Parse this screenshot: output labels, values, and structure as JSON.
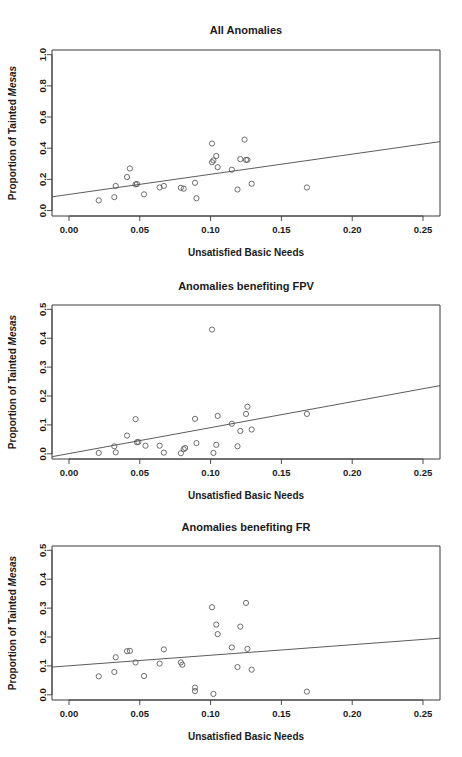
{
  "figure": {
    "shared_xlabel": "Unsatisfied Basic Needs",
    "shared_ylabel_prefix": "Proportion of Tainted ",
    "shared_ylabel_italic": "Mesas"
  },
  "chart_data": [
    {
      "type": "scatter",
      "title": "All Anomalies",
      "xlabel": "Unsatisfied Basic Needs",
      "ylabel": "Proportion of Tainted Mesas",
      "xlim": [
        -0.012,
        0.262
      ],
      "ylim": [
        -0.035,
        1.03
      ],
      "xticks": [
        0.0,
        0.05,
        0.1,
        0.15,
        0.2,
        0.25
      ],
      "xticklabels": [
        "0.00",
        "0.05",
        "0.10",
        "0.15",
        "0.20",
        "0.25"
      ],
      "yticks": [
        0.0,
        0.2,
        0.4,
        0.6,
        0.8,
        1.0
      ],
      "yticklabels": [
        "0.0",
        "0.2",
        "0.4",
        "0.6",
        "0.8",
        "1.0"
      ],
      "grid": false,
      "legend": "none",
      "marker": "open-circle",
      "x": [
        0.021,
        0.032,
        0.033,
        0.041,
        0.043,
        0.047,
        0.048,
        0.053,
        0.064,
        0.067,
        0.079,
        0.081,
        0.089,
        0.09,
        0.101,
        0.101,
        0.102,
        0.104,
        0.105,
        0.115,
        0.119,
        0.121,
        0.124,
        0.125,
        0.126,
        0.129,
        0.168
      ],
      "y": [
        0.065,
        0.086,
        0.158,
        0.215,
        0.27,
        0.168,
        0.17,
        0.104,
        0.148,
        0.158,
        0.146,
        0.14,
        0.178,
        0.079,
        0.43,
        0.31,
        0.322,
        0.35,
        0.278,
        0.262,
        0.135,
        0.33,
        0.455,
        0.325,
        0.325,
        0.172,
        0.148
      ],
      "fit_line": {
        "x0": -0.012,
        "y0": 0.088,
        "x1": 0.262,
        "y1": 0.442
      }
    },
    {
      "type": "scatter",
      "title": "Anomalies benefiting FPV",
      "xlabel": "Unsatisfied Basic Needs",
      "ylabel": "Proportion of Tainted Mesas",
      "xlim": [
        -0.012,
        0.262
      ],
      "ylim": [
        -0.018,
        0.515
      ],
      "xticks": [
        0.0,
        0.05,
        0.1,
        0.15,
        0.2,
        0.25
      ],
      "xticklabels": [
        "0.00",
        "0.05",
        "0.10",
        "0.15",
        "0.20",
        "0.25"
      ],
      "yticks": [
        0.0,
        0.1,
        0.2,
        0.3,
        0.4,
        0.5
      ],
      "yticklabels": [
        "0.0",
        "0.1",
        "0.2",
        "0.3",
        "0.4",
        "0.5"
      ],
      "grid": false,
      "legend": "none",
      "marker": "open-circle",
      "x": [
        0.021,
        0.032,
        0.033,
        0.041,
        0.047,
        0.048,
        0.049,
        0.054,
        0.064,
        0.067,
        0.079,
        0.081,
        0.082,
        0.089,
        0.09,
        0.101,
        0.102,
        0.104,
        0.105,
        0.115,
        0.119,
        0.121,
        0.125,
        0.126,
        0.129,
        0.168
      ],
      "y": [
        0.003,
        0.026,
        0.005,
        0.063,
        0.12,
        0.04,
        0.041,
        0.028,
        0.028,
        0.004,
        0.002,
        0.016,
        0.02,
        0.121,
        0.037,
        0.43,
        0.003,
        0.031,
        0.131,
        0.104,
        0.026,
        0.079,
        0.138,
        0.163,
        0.084,
        0.138
      ],
      "fit_line": {
        "x0": -0.012,
        "y0": -0.01,
        "x1": 0.262,
        "y1": 0.236
      }
    },
    {
      "type": "scatter",
      "title": "Anomalies benefiting FR",
      "xlabel": "Unsatisfied Basic Needs",
      "ylabel": "Proportion of Tainted Mesas",
      "xlim": [
        -0.012,
        0.262
      ],
      "ylim": [
        -0.018,
        0.515
      ],
      "xticks": [
        0.0,
        0.05,
        0.1,
        0.15,
        0.2,
        0.25
      ],
      "xticklabels": [
        "0.00",
        "0.05",
        "0.10",
        "0.15",
        "0.20",
        "0.25"
      ],
      "yticks": [
        0.0,
        0.1,
        0.2,
        0.3,
        0.4,
        0.5
      ],
      "yticklabels": [
        "0.0",
        "0.1",
        "0.2",
        "0.3",
        "0.4",
        "0.5"
      ],
      "grid": false,
      "legend": "none",
      "marker": "open-circle",
      "x": [
        0.021,
        0.032,
        0.033,
        0.041,
        0.043,
        0.047,
        0.053,
        0.064,
        0.067,
        0.079,
        0.08,
        0.089,
        0.089,
        0.101,
        0.102,
        0.104,
        0.105,
        0.115,
        0.119,
        0.121,
        0.125,
        0.126,
        0.129,
        0.168
      ],
      "y": [
        0.064,
        0.079,
        0.13,
        0.151,
        0.152,
        0.112,
        0.065,
        0.108,
        0.157,
        0.112,
        0.104,
        0.025,
        0.013,
        0.303,
        0.003,
        0.243,
        0.21,
        0.164,
        0.096,
        0.236,
        0.318,
        0.159,
        0.087,
        0.011
      ],
      "fit_line": {
        "x0": -0.012,
        "y0": 0.096,
        "x1": 0.262,
        "y1": 0.196
      }
    }
  ]
}
